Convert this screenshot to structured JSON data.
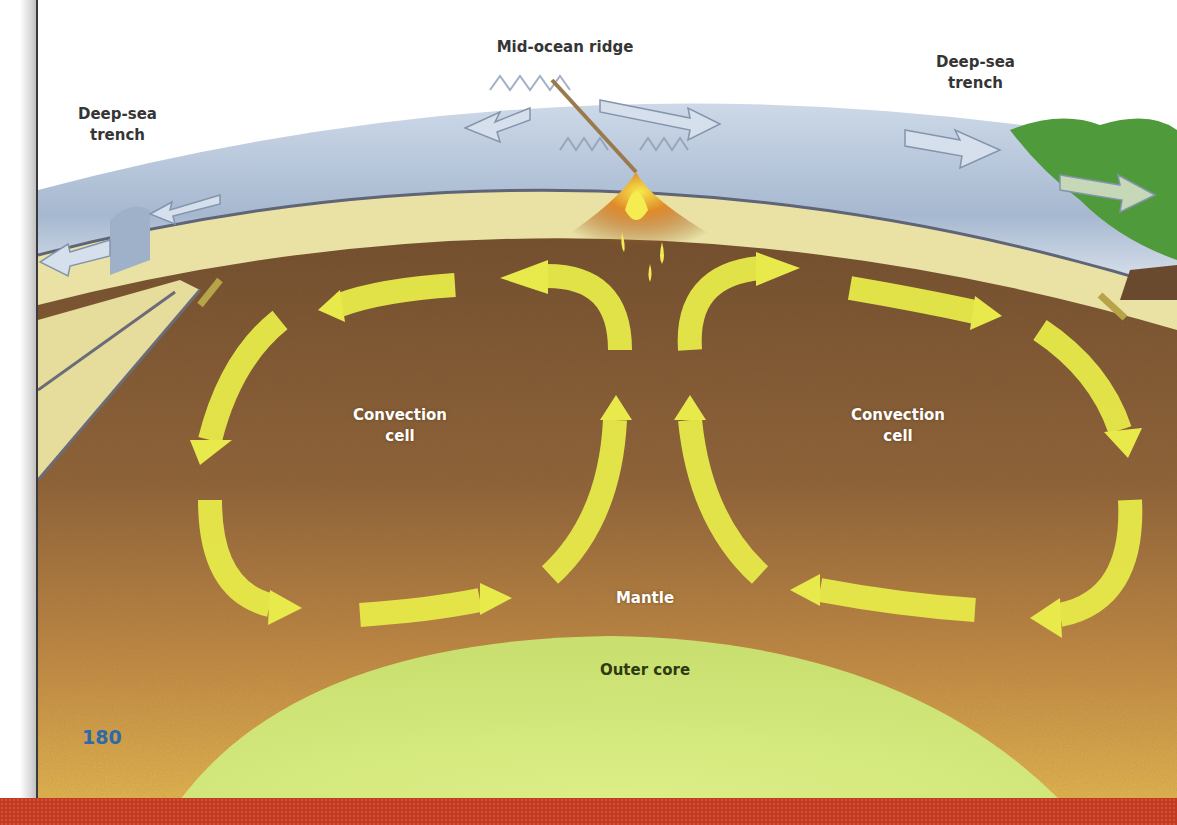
{
  "labels": {
    "mid_ocean_ridge": "Mid-ocean ridge",
    "trench_left": "Deep-sea\ntrench",
    "trench_right": "Deep-sea\ntrench",
    "convection_left": "Convection\ncell",
    "convection_right": "Convection\ncell",
    "mantle": "Mantle",
    "outer_core": "Outer core"
  },
  "page_number": "180",
  "colors": {
    "ocean_plate": "#b3c4da",
    "crust": "#e9e2a4",
    "mantle_dark": "#7a5634",
    "mantle_light": "#dca64a",
    "outer_core": "#d4ea78",
    "arrow": "#e7ea4a",
    "land": "#4f9a3a",
    "footer": "#c13a24",
    "page_number": "#2f6aa8"
  },
  "icons": [
    "convection-arrow-icon",
    "plate-motion-arrow-icon",
    "magma-rise-icon"
  ]
}
